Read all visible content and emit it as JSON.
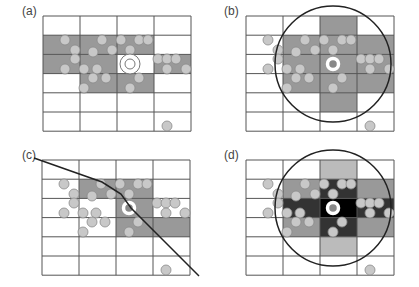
{
  "figure": {
    "grid": {
      "cols": 4,
      "rows": 6,
      "cell_w": 37,
      "cell_h": 19.2
    },
    "colors": {
      "background": "#ffffff",
      "grid_line": "#555555",
      "cell_shade": "#999999",
      "cell_light": "#bbbbbb",
      "cell_dark": "#333333",
      "cell_black": "#000000",
      "particle_fill": "#c8c8c8",
      "particle_stroke": "#8a8a8a",
      "outline": "#222222"
    },
    "particle_radius": 5,
    "particles": [
      [
        22,
        24
      ],
      [
        32,
        34
      ],
      [
        32,
        43
      ],
      [
        22,
        53
      ],
      [
        59,
        24
      ],
      [
        50,
        36
      ],
      [
        69,
        34
      ],
      [
        41,
        53
      ],
      [
        54,
        53
      ],
      [
        50,
        62
      ],
      [
        63,
        62
      ],
      [
        41,
        72
      ],
      [
        78,
        24
      ],
      [
        96,
        24
      ],
      [
        105,
        24
      ],
      [
        87,
        34
      ],
      [
        96,
        62
      ],
      [
        87,
        72
      ],
      [
        115,
        43
      ],
      [
        124,
        43
      ],
      [
        133,
        43
      ],
      [
        124,
        53
      ],
      [
        143,
        53
      ],
      [
        124,
        110
      ]
    ],
    "center_particle": [
      87,
      48
    ]
  },
  "panels": [
    {
      "id": "a",
      "label": "(a)",
      "origin": [
        43,
        16
      ],
      "label_pos": [
        22,
        11
      ],
      "shaded_cells": [
        [
          0,
          1
        ],
        [
          1,
          1
        ],
        [
          2,
          1
        ],
        [
          0,
          2
        ],
        [
          1,
          2
        ],
        [
          3,
          2
        ],
        [
          1,
          3
        ],
        [
          2,
          3
        ]
      ],
      "white_center_cell": [
        2,
        2
      ],
      "center_style": "double-ring"
    },
    {
      "id": "b",
      "label": "(b)",
      "origin": [
        246,
        16
      ],
      "label_pos": [
        224,
        11
      ],
      "shaded_cells": [
        [
          2,
          0
        ],
        [
          1,
          1
        ],
        [
          2,
          1
        ],
        [
          3,
          1
        ],
        [
          1,
          2
        ],
        [
          2,
          2
        ],
        [
          3,
          2
        ],
        [
          1,
          3
        ],
        [
          2,
          3
        ],
        [
          3,
          3
        ],
        [
          2,
          4
        ]
      ],
      "circle_radius": 58,
      "center_style": "thick-white-ring"
    },
    {
      "id": "c",
      "label": "(c)",
      "origin": [
        42,
        160
      ],
      "label_pos": [
        22,
        155
      ],
      "shaded_cells": [
        [
          1,
          1
        ],
        [
          2,
          1
        ],
        [
          2,
          2
        ],
        [
          2,
          3
        ],
        [
          3,
          3
        ]
      ],
      "cutoff_line": [
        [
          -8,
          -2
        ],
        [
          60,
          22
        ],
        [
          79,
          34
        ],
        [
          89,
          48
        ],
        [
          114,
          73
        ],
        [
          157,
          116
        ]
      ],
      "center_style": "thick-white-ring"
    },
    {
      "id": "d",
      "label": "(d)",
      "origin": [
        246,
        160
      ],
      "label_pos": [
        224,
        155
      ],
      "light_cells": [
        [
          2,
          0
        ],
        [
          2,
          4
        ]
      ],
      "medium_cells": [
        [
          1,
          1
        ],
        [
          3,
          1
        ],
        [
          1,
          3
        ],
        [
          3,
          3
        ]
      ],
      "dark_cells": [
        [
          2,
          1
        ],
        [
          1,
          2
        ],
        [
          3,
          2
        ],
        [
          2,
          3
        ]
      ],
      "black_cells": [
        [
          2,
          2
        ]
      ],
      "circle_radius": 58,
      "center_style": "thick-white-ring"
    }
  ]
}
